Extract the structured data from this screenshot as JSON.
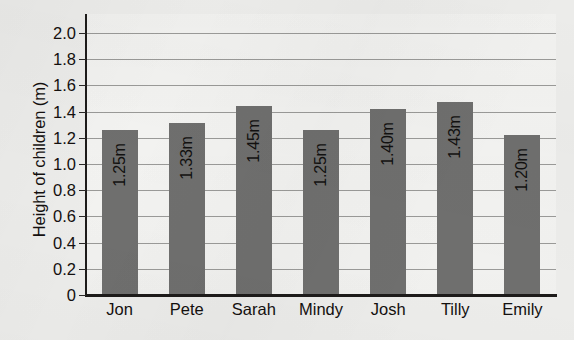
{
  "chart_data": {
    "type": "bar",
    "title": "",
    "xlabel": "",
    "ylabel": "Height of children (m)",
    "categories": [
      "Jon",
      "Pete",
      "Sarah",
      "Mindy",
      "Josh",
      "Tilly",
      "Emily"
    ],
    "values": [
      1.25,
      1.33,
      1.45,
      1.25,
      1.4,
      1.43,
      1.2
    ],
    "value_labels": [
      "1.25m",
      "1.33m",
      "1.45m",
      "1.25m",
      "1.40m",
      "1.43m",
      "1.20m"
    ],
    "bar_drawn_tops": [
      1.26,
      1.31,
      1.44,
      1.26,
      1.42,
      1.47,
      1.22
    ],
    "ylim": [
      0,
      2.0
    ],
    "ytick_step": 0.2,
    "ytick_labels": [
      "2.0",
      "1.8",
      "1.6",
      "1.4",
      "1.2",
      "1.0",
      "0.8",
      "0.6",
      "0.4",
      "0.2",
      "0"
    ],
    "ytick_values": [
      2.0,
      1.8,
      1.6,
      1.4,
      1.2,
      1.0,
      0.8,
      0.6,
      0.4,
      0.2,
      0
    ],
    "grid": true,
    "grid_axis": "y",
    "legend": false,
    "legend_position": "none",
    "series": [
      {
        "name": "Height of children (m)",
        "values": [
          1.25,
          1.33,
          1.45,
          1.25,
          1.4,
          1.43,
          1.2
        ]
      }
    ],
    "colors": {
      "bar_fill": "#6f6f6e",
      "plot_background": "#f3f3f1",
      "page_background": "#ececea",
      "axis_line": "#1d1b1a",
      "gridline": "#9a9a98",
      "text": "#14100f"
    }
  }
}
